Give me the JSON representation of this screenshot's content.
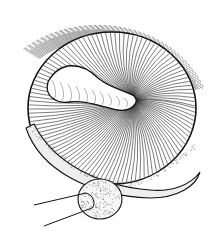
{
  "figure": {
    "colors": {
      "background": "#ffffff",
      "ink": "#111111",
      "stipple": "#555555"
    }
  }
}
